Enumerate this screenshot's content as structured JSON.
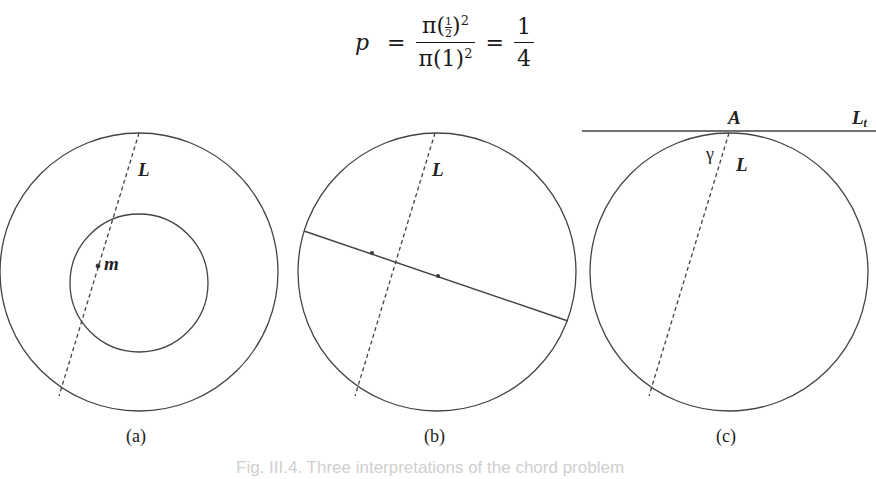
{
  "formula": {
    "lhs": "p",
    "equals": "=",
    "numerator_prefix": "π(",
    "numerator_inner_num": "1",
    "numerator_inner_den": "2",
    "numerator_suffix": ")",
    "numerator_exp": "2",
    "denominator": "π(1)",
    "denominator_exp": "2",
    "result_num": "1",
    "result_den": "4"
  },
  "panels": [
    {
      "id": "a",
      "caption": "(a)",
      "labels": {
        "chord": "L",
        "midpoint": "m"
      }
    },
    {
      "id": "b",
      "caption": "(b)",
      "labels": {
        "chord": "L"
      }
    },
    {
      "id": "c",
      "caption": "(c)",
      "labels": {
        "chord": "L",
        "point": "A",
        "tangent": "L_t",
        "angle": "γ"
      }
    }
  ],
  "figure_caption": "Fig. III.4. Three interpretations of the chord problem"
}
